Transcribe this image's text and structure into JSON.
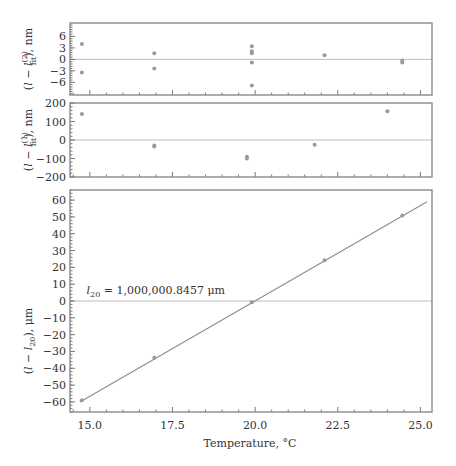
{
  "chart_data": [
    {
      "id": "residual2",
      "type": "scatter",
      "title": "",
      "xlabel": "",
      "ylabel": "(l − l_fit^(2)), nm",
      "ylabel_parts": {
        "pre": "(",
        "l": "l",
        "mid": " − ",
        "l2": "l",
        "sub": "fit",
        "sup": "(2)",
        "post": "), nm"
      },
      "xlim": [
        14.4,
        25.35
      ],
      "ylim": [
        -9.3,
        9.5
      ],
      "yticks": [
        6,
        3,
        0,
        -3,
        -6
      ],
      "ytick_labels": [
        "6",
        "3",
        "0",
        "−3",
        "−6"
      ],
      "zero_line": true,
      "points": [
        {
          "x": 14.76,
          "y": 4.0
        },
        {
          "x": 14.76,
          "y": -3.4
        },
        {
          "x": 16.95,
          "y": 1.6
        },
        {
          "x": 16.95,
          "y": -2.4
        },
        {
          "x": 19.9,
          "y": 3.4
        },
        {
          "x": 19.9,
          "y": 2.1
        },
        {
          "x": 19.9,
          "y": 1.6
        },
        {
          "x": 19.9,
          "y": -0.8
        },
        {
          "x": 19.9,
          "y": -6.8
        },
        {
          "x": 22.1,
          "y": 1.1
        },
        {
          "x": 24.45,
          "y": -0.3
        },
        {
          "x": 24.45,
          "y": -0.8
        }
      ]
    },
    {
      "id": "residual1",
      "type": "scatter",
      "title": "",
      "xlabel": "",
      "ylabel": "(l − l_fit^(1)), nm",
      "ylabel_parts": {
        "pre": "(",
        "l": "l",
        "mid": " − ",
        "l2": "l",
        "sub": "fit",
        "sup": "(1)",
        "post": "), nm"
      },
      "xlim": [
        14.4,
        25.35
      ],
      "ylim": [
        -200,
        200
      ],
      "yticks": [
        200,
        100,
        0,
        -100,
        -200
      ],
      "ytick_labels": [
        "200",
        "100",
        "0",
        "−100",
        "−200"
      ],
      "zero_line": true,
      "points": [
        {
          "x": 14.76,
          "y": 140
        },
        {
          "x": 16.95,
          "y": -30
        },
        {
          "x": 16.95,
          "y": -35
        },
        {
          "x": 19.75,
          "y": -90
        },
        {
          "x": 19.75,
          "y": -100
        },
        {
          "x": 21.8,
          "y": -25
        },
        {
          "x": 24.0,
          "y": 155
        }
      ]
    },
    {
      "id": "main",
      "type": "line",
      "title": "",
      "xlabel": "Temperature, °C",
      "ylabel": "(l − l_20), μm",
      "ylabel_parts": {
        "pre": "(",
        "l": "l",
        "mid": " − ",
        "l2": "l",
        "sub": "20",
        "post": "), μm"
      },
      "xlim": [
        14.4,
        25.35
      ],
      "ylim": [
        -66,
        66
      ],
      "xticks": [
        15.0,
        17.5,
        20.0,
        22.5,
        25.0
      ],
      "xtick_labels": [
        "15.0",
        "17.5",
        "20.0",
        "22.5",
        "25.0"
      ],
      "yticks": [
        60,
        50,
        40,
        30,
        20,
        10,
        0,
        -10,
        -20,
        -30,
        -40,
        -50,
        -60
      ],
      "ytick_labels": [
        "60",
        "50",
        "40",
        "30",
        "20",
        "10",
        "0",
        "−10",
        "−20",
        "−30",
        "−40",
        "−50",
        "−60"
      ],
      "zero_line": true,
      "annotation": {
        "symbol": "l",
        "sub": "20",
        "text": " = 1,000,000.8457 μm",
        "x": 14.9,
        "y": 4
      },
      "fit_line": {
        "x0": 14.7,
        "y0": -60,
        "x1": 25.2,
        "y1": 59
      },
      "points": [
        {
          "x": 14.76,
          "y": -59.0
        },
        {
          "x": 16.95,
          "y": -33.8
        },
        {
          "x": 19.9,
          "y": -0.8
        },
        {
          "x": 22.1,
          "y": 24.3
        },
        {
          "x": 24.45,
          "y": 50.8
        }
      ]
    }
  ]
}
